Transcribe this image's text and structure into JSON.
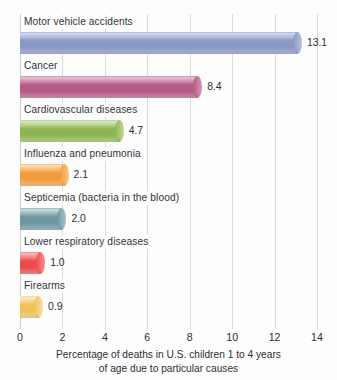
{
  "chart_data": {
    "type": "bar",
    "orientation": "horizontal",
    "title": "",
    "subtitle": "",
    "xlabel": "Percentage of deaths in U.S. children 1 to 4 years of age due to particular causes",
    "xlabel_line1": "Percentage of deaths in U.S. children 1 to 4 years",
    "xlabel_line2": "of age due to particular causes",
    "ylabel": "",
    "xlim": [
      0,
      14
    ],
    "xticks": [
      0,
      2,
      4,
      6,
      8,
      10,
      12,
      14
    ],
    "xtick_labels": [
      "0",
      "2",
      "4",
      "6",
      "8",
      "10",
      "12",
      "14"
    ],
    "grid": true,
    "grid_axis": "x",
    "legend": false,
    "categories": [
      "Motor vehicle accidents",
      "Cancer",
      "Cardiovascular diseases",
      "Influenza and pneumonia",
      "Septicemia (bacteria in the blood)",
      "Lower respiratory diseases",
      "Firearms"
    ],
    "values": [
      13.1,
      8.4,
      4.7,
      2.1,
      2.0,
      1.0,
      0.9
    ],
    "value_labels": [
      "13.1",
      "8.4",
      "4.7",
      "2.1",
      "2.0",
      "1.0",
      "0.9"
    ],
    "bar_colors": [
      "#8a97c4",
      "#b55a85",
      "#8bb551",
      "#f29b3d",
      "#6e97a0",
      "#ef4a4a",
      "#eec256"
    ],
    "bar_colors_light": [
      "#b8c1de",
      "#d49ab8",
      "#c2da97",
      "#f8c98a",
      "#a8c3c9",
      "#f79292",
      "#f6dfa6"
    ],
    "background_color": "#fdfdfd",
    "gridline_color": "#d8dade",
    "text_color": "#2e3033"
  },
  "bars": [
    {
      "label": "Motor vehicle accidents",
      "value": 13.1,
      "value_label": "13.1",
      "color": "#8a97c4",
      "color_light": "#b8c1de"
    },
    {
      "label": "Cancer",
      "value": 8.4,
      "value_label": "8.4",
      "color": "#b55a85",
      "color_light": "#d49ab8"
    },
    {
      "label": "Cardiovascular diseases",
      "value": 4.7,
      "value_label": "4.7",
      "color": "#8bb551",
      "color_light": "#c2da97"
    },
    {
      "label": "Influenza and pneumonia",
      "value": 2.1,
      "value_label": "2.1",
      "color": "#f29b3d",
      "color_light": "#f8c98a"
    },
    {
      "label": "Septicemia (bacteria in the blood)",
      "value": 2.0,
      "value_label": "2.0",
      "color": "#6e97a0",
      "color_light": "#a8c3c9"
    },
    {
      "label": "Lower respiratory diseases",
      "value": 1.0,
      "value_label": "1.0",
      "color": "#ef4a4a",
      "color_light": "#f79292"
    },
    {
      "label": "Firearms",
      "value": 0.9,
      "value_label": "0.9",
      "color": "#eec256",
      "color_light": "#f6dfa6"
    }
  ],
  "axis": {
    "ticks": [
      "0",
      "2",
      "4",
      "6",
      "8",
      "10",
      "12",
      "14"
    ],
    "title_line1": "Percentage of deaths in U.S. children 1 to 4 years",
    "title_line2": "of age due to particular causes"
  }
}
